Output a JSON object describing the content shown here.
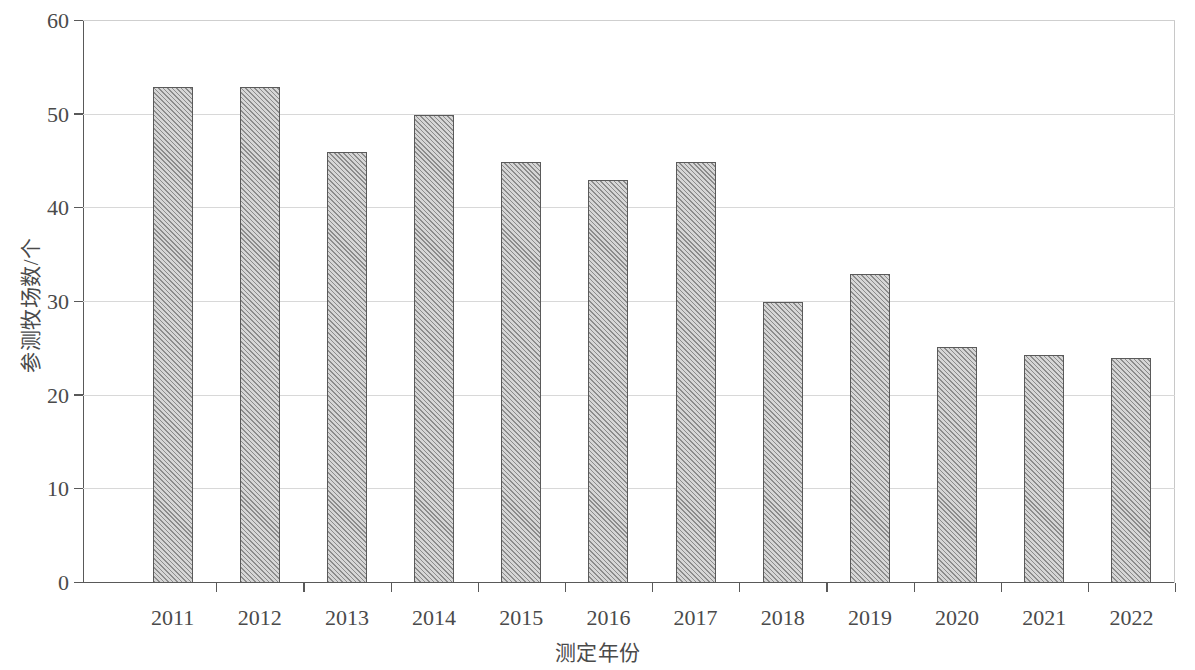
{
  "chart_data": {
    "type": "bar",
    "title": "",
    "xlabel": "测定年份",
    "ylabel": "参测牧场数/个",
    "categories": [
      "2011",
      "2012",
      "2013",
      "2014",
      "2015",
      "2016",
      "2017",
      "2018",
      "2019",
      "2020",
      "2021",
      "2022"
    ],
    "values": [
      53,
      53,
      46,
      50,
      45,
      43,
      45,
      30,
      33,
      25.2,
      24.3,
      24
    ],
    "ylim": [
      0,
      60
    ],
    "yticks": [
      0,
      10,
      20,
      30,
      40,
      50,
      60
    ],
    "ytick_labels": [
      "0",
      "10",
      "20",
      "30",
      "40",
      "50",
      "60"
    ],
    "grid": true,
    "grid_axis": "y",
    "legend": false,
    "legend_position": "none",
    "bar_fill": "diagonal-hatch",
    "bar_color": "#d6d6d6",
    "bar_hatch_color": "#8c8c8c",
    "bar_edge_color": "#5a5a5a",
    "gridline_color": "#d8d8d8",
    "axis_color": "#595959",
    "text_color": "#4a4a4a",
    "background": "#ffffff"
  }
}
